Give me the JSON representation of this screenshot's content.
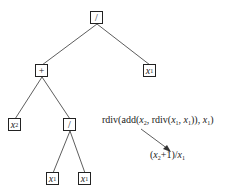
{
  "tree": {
    "nodes": [
      {
        "id": "root",
        "label": "/",
        "kind": "operator",
        "x": 97,
        "y": 18
      },
      {
        "id": "plus",
        "label": "+",
        "kind": "operator",
        "x": 42,
        "y": 71
      },
      {
        "id": "x1_right",
        "label": "x",
        "sub": "1",
        "kind": "variable",
        "x": 150,
        "y": 71
      },
      {
        "id": "x2",
        "label": "x",
        "sub": "2",
        "kind": "variable",
        "x": 15,
        "y": 125
      },
      {
        "id": "div_lower",
        "label": "/",
        "kind": "operator",
        "x": 70,
        "y": 125
      },
      {
        "id": "x1_leaf_a",
        "label": "x",
        "sub": "1",
        "kind": "variable",
        "x": 53,
        "y": 179
      },
      {
        "id": "x1_leaf_b",
        "label": "x",
        "sub": "1",
        "kind": "variable",
        "x": 85,
        "y": 179
      }
    ],
    "edges": [
      [
        "root",
        "plus"
      ],
      [
        "root",
        "x1_right"
      ],
      [
        "plus",
        "x2"
      ],
      [
        "plus",
        "div_lower"
      ],
      [
        "div_lower",
        "x1_leaf_a"
      ],
      [
        "div_lower",
        "x1_leaf_b"
      ]
    ]
  },
  "expression": {
    "p1": "rdiv(add(",
    "v1": "x",
    "s1": "2",
    "p2": ", rdiv(",
    "v2": "x",
    "s2": "1",
    "p3": ", ",
    "v3": "x",
    "s3": "1",
    "p4": ")), ",
    "v4": "x",
    "s4": "1",
    "p5": ")"
  },
  "simplified": {
    "p1": "(",
    "v1": "x",
    "s1": "2",
    "p2": "+1)/",
    "v2": "x",
    "s2": "1"
  },
  "arrow": {
    "from": [
      141,
      129
    ],
    "to": [
      170,
      151
    ]
  }
}
